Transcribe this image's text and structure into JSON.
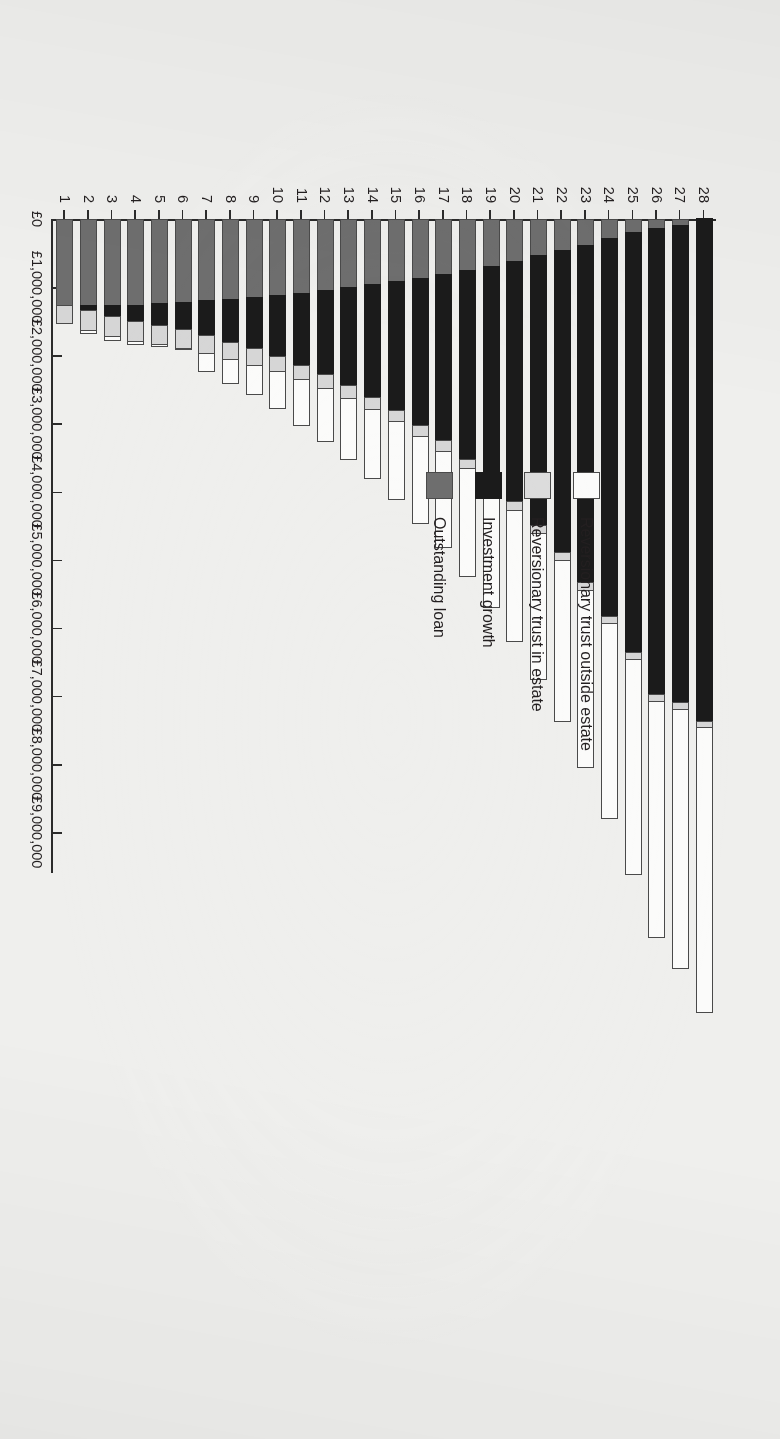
{
  "chart_data": {
    "type": "bar",
    "subtype": "stacked-horizontal",
    "orientation": "rotated-90-clockwise",
    "title": "",
    "subtitle": "",
    "xlabel": "",
    "ylabel": "",
    "grid": false,
    "legend_position": "plot-area-left",
    "categories": [
      "1",
      "2",
      "3",
      "4",
      "5",
      "6",
      "7",
      "8",
      "9",
      "10",
      "11",
      "12",
      "13",
      "14",
      "15",
      "16",
      "17",
      "18",
      "19",
      "20",
      "21",
      "22",
      "23",
      "24",
      "25",
      "26",
      "27",
      "28"
    ],
    "value_axis": {
      "min": 0,
      "max": 9000000,
      "step": 1000000,
      "tick_labels": [
        "£0",
        "£1,000,000",
        "£2,000,000",
        "£3,000,000",
        "£4,000,000",
        "£5,000,000",
        "£6,000,000",
        "£7,000,000",
        "£8,000,000",
        "£9,000,000"
      ],
      "tick_values": [
        0,
        1000000,
        2000000,
        3000000,
        4000000,
        5000000,
        6000000,
        7000000,
        8000000,
        9000000
      ],
      "currency_symbol": "£"
    },
    "series": [
      {
        "name": "Outstanding loan",
        "color": "#6e6e6e",
        "values": [
          1270000,
          1270000,
          1270000,
          1270000,
          1250000,
          1230000,
          1210000,
          1190000,
          1160000,
          1130000,
          1100000,
          1060000,
          1020000,
          975000,
          930000,
          880000,
          820000,
          760000,
          700000,
          630000,
          550000,
          470000,
          390000,
          300000,
          210000,
          150000,
          110000,
          0
        ]
      },
      {
        "name": "Investment growth",
        "color": "#1b1b1b",
        "values": [
          0,
          95000,
          180000,
          250000,
          330000,
          420000,
          520000,
          640000,
          770000,
          910000,
          1070000,
          1250000,
          1440000,
          1660000,
          1900000,
          2170000,
          2460000,
          2790000,
          3140000,
          3540000,
          3970000,
          4450000,
          4970000,
          5550000,
          6170000,
          6850000,
          7010000,
          7400000
        ]
      },
      {
        "name": "Reversionary trust in estate",
        "color": "#d6d6d6",
        "values": [
          285000,
          305000,
          310000,
          310000,
          300000,
          290000,
          275000,
          265000,
          250000,
          240000,
          230000,
          215000,
          205000,
          195000,
          185000,
          175000,
          165000,
          155000,
          150000,
          145000,
          140000,
          135000,
          130000,
          125000,
          120000,
          115000,
          110000,
          105000
        ]
      },
      {
        "name": "Reversionary trust outside estate",
        "color": "#fbfbfa",
        "values": [
          0,
          60000,
          75000,
          60000,
          40000,
          25000,
          290000,
          365000,
          455000,
          560000,
          680000,
          790000,
          910000,
          1030000,
          1150000,
          1290000,
          1430000,
          1590000,
          1760000,
          1940000,
          2150000,
          2370000,
          2620000,
          2880000,
          3180000,
          3490000,
          3830000,
          4200000
        ]
      }
    ],
    "bar_totals": [
      1555000,
      1730000,
      1835000,
      1890000,
      1920000,
      1965000,
      2295000,
      2460000,
      2635000,
      2840000,
      3080000,
      3315000,
      3575000,
      3860000,
      4165000,
      4515000,
      4875000,
      5295000,
      5750000,
      6255000,
      6810000,
      7425000,
      8110000,
      8855000,
      9680000,
      10605000,
      11060000,
      11705000
    ]
  },
  "legend": {
    "items": [
      {
        "label": "Reversionary trust outside estate",
        "key": "outest"
      },
      {
        "label": "Reversionary trust in estate",
        "key": "inest"
      },
      {
        "label": "Investment growth",
        "key": "growth"
      },
      {
        "label": "Outstanding loan",
        "key": "loan"
      }
    ]
  },
  "colors": {
    "background": "#efefed",
    "axis": "#2b2b2b",
    "text": "#231f20",
    "outstanding_loan": "#6e6e6e",
    "investment_growth": "#1b1b1b",
    "trust_in_estate": "#d6d6d6",
    "trust_outside_estate": "#fbfbfa"
  }
}
